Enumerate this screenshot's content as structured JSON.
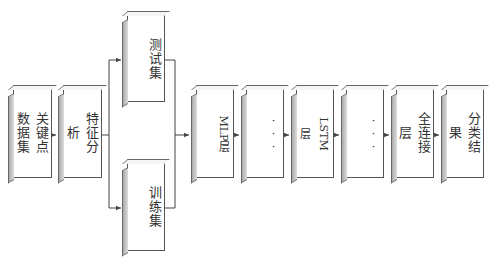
{
  "diagram": {
    "nodes": [
      {
        "id": "keypoint",
        "label": "关键点数据集",
        "x": 13,
        "y": 89,
        "w": 39,
        "h": 89,
        "style": "upright"
      },
      {
        "id": "feature",
        "label": "特征分析",
        "x": 63,
        "y": 89,
        "w": 39,
        "h": 89,
        "style": "upright"
      },
      {
        "id": "test",
        "label": "测试集",
        "x": 127,
        "y": 15,
        "w": 38,
        "h": 87,
        "style": "upright"
      },
      {
        "id": "train",
        "label": "训练集",
        "x": 127,
        "y": 163,
        "w": 38,
        "h": 88,
        "style": "upright"
      },
      {
        "id": "mlp",
        "label": "MLP层",
        "x": 196,
        "y": 89,
        "w": 38,
        "h": 89,
        "style": "rotated"
      },
      {
        "id": "ellipsis1",
        "label": "···",
        "x": 246,
        "y": 89,
        "w": 38,
        "h": 89,
        "style": "dots"
      },
      {
        "id": "lstm",
        "label": "LSTM层",
        "x": 296,
        "y": 89,
        "w": 38,
        "h": 89,
        "style": "rotated"
      },
      {
        "id": "ellipsis2",
        "label": "···",
        "x": 346,
        "y": 89,
        "w": 38,
        "h": 89,
        "style": "dots"
      },
      {
        "id": "fc",
        "label": "全连接层",
        "x": 396,
        "y": 89,
        "w": 38,
        "h": 89,
        "style": "upright"
      },
      {
        "id": "result",
        "label": "分类结果",
        "x": 446,
        "y": 89,
        "w": 38,
        "h": 89,
        "style": "upright"
      }
    ],
    "edges": [
      {
        "from": "keypoint",
        "to": "feature"
      },
      {
        "from": "feature",
        "to": "test"
      },
      {
        "from": "feature",
        "to": "train"
      },
      {
        "from": "test",
        "to": "mlp"
      },
      {
        "from": "train",
        "to": "mlp"
      },
      {
        "from": "mlp",
        "to": "ellipsis1"
      },
      {
        "from": "ellipsis1",
        "to": "lstm"
      },
      {
        "from": "lstm",
        "to": "ellipsis2"
      },
      {
        "from": "ellipsis2",
        "to": "fc"
      },
      {
        "from": "fc",
        "to": "result"
      }
    ],
    "colors": {
      "line": "#444444",
      "box_border": "#555555",
      "box_side": "#bbbbbb",
      "background": "#ffffff"
    }
  }
}
